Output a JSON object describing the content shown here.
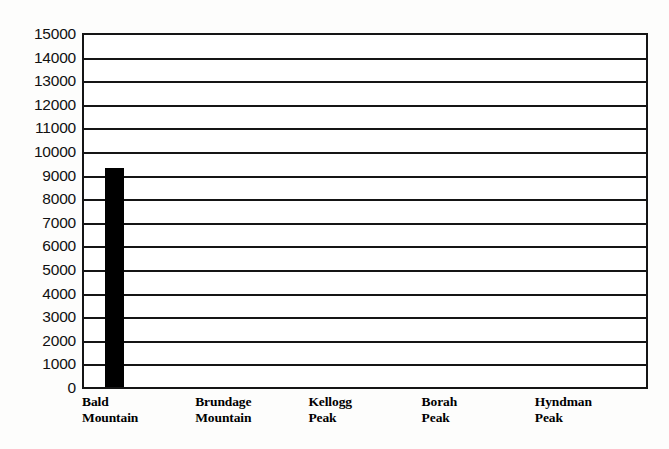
{
  "chart_data": {
    "type": "bar",
    "title": "",
    "subtitle": "",
    "xlabel": "",
    "ylabel": "",
    "categories": [
      "Bald Mountain",
      "Brundage Mountain",
      "Kellogg Peak",
      "Borah Peak",
      "Hyndman Peak"
    ],
    "category_lines": [
      [
        "Bald",
        "Mountain"
      ],
      [
        "Brundage",
        "Mountain"
      ],
      [
        "Kellogg",
        "Peak"
      ],
      [
        "Borah",
        "Peak"
      ],
      [
        "Hyndman",
        "Peak"
      ]
    ],
    "values": [
      9300,
      0,
      0,
      0,
      0
    ],
    "ylim": [
      0,
      15000
    ],
    "ytick_step": 1000,
    "yticks": [
      "15000",
      "14000",
      "13000",
      "12000",
      "11000",
      "10000",
      "9000",
      "8000",
      "7000",
      "6000",
      "5000",
      "4000",
      "3000",
      "2000",
      "1000",
      "0"
    ],
    "ytick_values": [
      15000,
      14000,
      13000,
      12000,
      11000,
      10000,
      9000,
      8000,
      7000,
      6000,
      5000,
      4000,
      3000,
      2000,
      1000,
      0
    ],
    "grid": true,
    "grid_axis": "y",
    "legend": false,
    "legend_position": "none",
    "bar_color": "#000000",
    "axis_color": "#151515",
    "background_color": "#ffffff"
  }
}
